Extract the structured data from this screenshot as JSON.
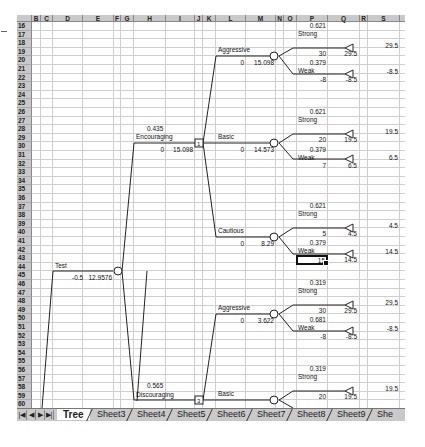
{
  "window": {
    "type": "spreadsheet-decision-tree"
  },
  "columns": [
    "B",
    "C",
    "D",
    "E",
    "F",
    "G",
    "H",
    "I",
    "J",
    "K",
    "L",
    "M",
    "N",
    "O",
    "P",
    "Q",
    "R",
    "S"
  ],
  "rows": [
    "16",
    "17",
    "18",
    "19",
    "20",
    "21",
    "22",
    "23",
    "24",
    "25",
    "26",
    "27",
    "28",
    "29",
    "30",
    "31",
    "32",
    "33",
    "34",
    "35",
    "36",
    "37",
    "38",
    "39",
    "40",
    "41",
    "42",
    "43",
    "44",
    "45",
    "46",
    "47",
    "48",
    "49",
    "50",
    "51",
    "52",
    "53",
    "54",
    "55",
    "56",
    "57",
    "58",
    "59",
    "60",
    "61"
  ],
  "tree": {
    "root": {
      "label": "Test",
      "cost": "-0.5",
      "value": "12.9576"
    },
    "branches": [
      {
        "prob": "0.435",
        "label": "Encouraging",
        "cost": "0",
        "value": "15.098",
        "node_id": "1",
        "options": [
          {
            "label": "Aggressive",
            "cost": "0",
            "value": "15.098",
            "outcomes": [
              {
                "prob": "0.621",
                "label": "Strong",
                "payoff": "30",
                "cum": "29.5",
                "end": "29.5"
              },
              {
                "prob": "0.379",
                "label": "Weak",
                "payoff": "-8",
                "cum": "-8.5",
                "end": "-8.5"
              }
            ]
          },
          {
            "label": "Basic",
            "cost": "0",
            "value": "14.573",
            "outcomes": [
              {
                "prob": "0.621",
                "label": "Strong",
                "payoff": "20",
                "cum": "19.5",
                "end": "19.5"
              },
              {
                "prob": "0.379",
                "label": "Weak",
                "payoff": "7",
                "cum": "6.5",
                "end": "6.5"
              }
            ]
          },
          {
            "label": "Cautious",
            "cost": "0",
            "value": "8.29",
            "outcomes": [
              {
                "prob": "0.621",
                "label": "Strong",
                "payoff": "5",
                "cum": "4.5",
                "end": "4.5"
              },
              {
                "prob": "0.379",
                "label": "Weak",
                "payoff": "15",
                "cum": "14.5",
                "end": "14.5"
              }
            ]
          }
        ]
      },
      {
        "prob": "0.565",
        "label": "Discouraging",
        "node_id": "3",
        "options": [
          {
            "label": "Aggressive",
            "cost": "0",
            "value": "3.622",
            "outcomes": [
              {
                "prob": "0.319",
                "label": "Strong",
                "payoff": "30",
                "cum": "29.5",
                "end": "29.5"
              },
              {
                "prob": "0.681",
                "label": "Weak",
                "payoff": "-8",
                "cum": "-8.5",
                "end": "-8.5"
              }
            ]
          },
          {
            "label": "Basic",
            "outcomes": [
              {
                "prob": "0.319",
                "label": "Strong",
                "payoff": "20",
                "cum": "19.5",
                "end": "19.5"
              }
            ]
          }
        ]
      }
    ]
  },
  "selected_cell": {
    "ref": "P44",
    "value": "15"
  },
  "tabs": {
    "nav": [
      "|◀",
      "◀",
      "▶",
      "▶|"
    ],
    "items": [
      {
        "label": "Tree",
        "active": true
      },
      {
        "label": "Sheet3"
      },
      {
        "label": "Sheet4"
      },
      {
        "label": "Sheet5"
      },
      {
        "label": "Sheet6"
      },
      {
        "label": "Sheet7"
      },
      {
        "label": "Sheet8"
      },
      {
        "label": "Sheet9"
      },
      {
        "label": "She"
      }
    ]
  }
}
